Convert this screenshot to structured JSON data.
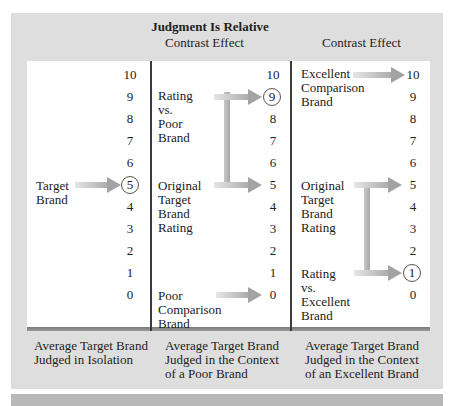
{
  "figure": {
    "title": "Judgment Is Relative",
    "columns": [
      {
        "heading": "",
        "scale": [
          "10",
          "9",
          "8",
          "7",
          "6",
          "5",
          "4",
          "3",
          "2",
          "1",
          "0"
        ],
        "circled_value": "5",
        "labels": [
          {
            "text": "Target\nBrand",
            "points_to": "5"
          }
        ],
        "caption": "Average Target Brand\nJudged in Isolation"
      },
      {
        "heading": "Contrast Effect",
        "scale": [
          "10",
          "9",
          "8",
          "7",
          "6",
          "5",
          "4",
          "3",
          "2",
          "1",
          "0"
        ],
        "circled_value": "9",
        "labels": [
          {
            "text": "Rating\nvs.\nPoor\nBrand",
            "points_to": "9"
          },
          {
            "text": "Original\nTarget\nBrand\nRating",
            "points_to": "5"
          },
          {
            "text": "Poor\nComparison\nBrand",
            "points_to": "0"
          }
        ],
        "caption": "Average Target Brand\nJudged in the Context\nof a Poor Brand"
      },
      {
        "heading": "Contrast Effect",
        "scale": [
          "10",
          "9",
          "8",
          "7",
          "6",
          "5",
          "4",
          "3",
          "2",
          "1",
          "0"
        ],
        "circled_value": "1",
        "labels": [
          {
            "text": "Excellent\nComparison\nBrand",
            "points_to": "10"
          },
          {
            "text": "Original\nTarget\nBrand\nRating",
            "points_to": "5"
          },
          {
            "text": "Rating\nvs.\nExcellent\nBrand",
            "points_to": "1"
          }
        ],
        "caption": "Average Target Brand\nJudged in the Context\nof an Excellent Brand"
      }
    ]
  },
  "colors": {
    "panel": "#dedede",
    "arrow": "#a3a3a3",
    "divider": "#3a3a3a"
  }
}
